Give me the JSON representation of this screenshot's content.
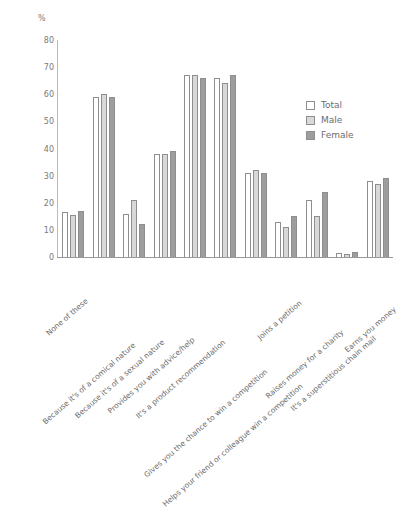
{
  "chart_data": {
    "type": "bar",
    "title": "",
    "xlabel": "",
    "ylabel": "%",
    "ylim": [
      0,
      80
    ],
    "yticks": [
      0,
      10,
      20,
      30,
      40,
      50,
      60,
      70,
      80
    ],
    "grid": false,
    "legend_position": "right",
    "categories": [
      "None of these",
      "Because it's of a comical nature",
      "Because it's of a sexual nature",
      "Provides you with advice/help",
      "It's a product recommendation",
      "Gives you the chance to win a competition",
      "Helps your friend or colleague win a competition",
      "Joins a petition",
      "Raises money for a charity",
      "It's a superstitious chain mail",
      "Earns you money"
    ],
    "series": [
      {
        "name": "Total",
        "color": "#ffffff",
        "values": [
          16.5,
          59,
          16,
          38,
          67,
          66,
          31,
          13,
          21,
          1.5,
          28
        ]
      },
      {
        "name": "Male",
        "color": "#d8d8d8",
        "values": [
          15.5,
          60,
          21,
          38,
          67,
          64,
          32,
          11,
          15,
          1.0,
          27
        ]
      },
      {
        "name": "Female",
        "color": "#9d9d9d",
        "values": [
          17.0,
          59,
          12,
          39,
          66,
          67,
          31,
          15,
          24,
          2.0,
          29
        ]
      }
    ]
  }
}
